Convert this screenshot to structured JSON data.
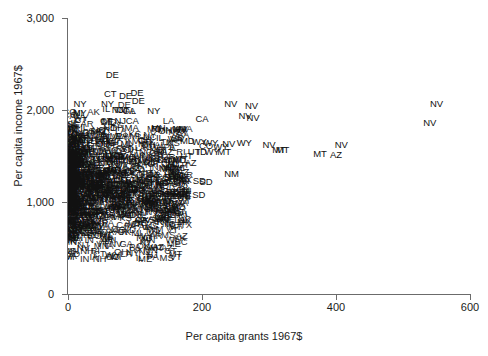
{
  "chart_data": {
    "type": "scatter",
    "title": "",
    "xlabel": "Per capita grants 1967$",
    "ylabel": "Per capita income 1967$",
    "xlim": [
      0,
      600
    ],
    "ylim": [
      0,
      3000
    ],
    "xticks": [
      0,
      200,
      400,
      600
    ],
    "xtick_labels": [
      "0",
      "200",
      "400",
      "600"
    ],
    "yticks": [
      0,
      1000,
      2000,
      3000
    ],
    "ytick_labels": [
      "0",
      "1,000",
      "2,000",
      "3,000"
    ],
    "grid": false,
    "legend": false,
    "marker_style": "text-label-state-abbreviation",
    "note": "Each plotted observation is drawn as a two-letter US state abbreviation rather than a symbol. Values below are read off the axes; the low-grant region is a dense overplotted cluster.",
    "points": [
      {
        "label": "DE",
        "x": 66,
        "y": 2380
      },
      {
        "label": "CT",
        "x": 63,
        "y": 2175
      },
      {
        "label": "DE",
        "x": 86,
        "y": 2155
      },
      {
        "label": "DE",
        "x": 103,
        "y": 2190
      },
      {
        "label": "DE",
        "x": 105,
        "y": 2100
      },
      {
        "label": "NY",
        "x": 18,
        "y": 2060
      },
      {
        "label": "NY",
        "x": 59,
        "y": 2060
      },
      {
        "label": "NV",
        "x": 243,
        "y": 2070
      },
      {
        "label": "NV",
        "x": 274,
        "y": 2045
      },
      {
        "label": "NV",
        "x": 550,
        "y": 2060
      },
      {
        "label": "NY",
        "x": 18,
        "y": 1965
      },
      {
        "label": "NJ",
        "x": 74,
        "y": 2000
      },
      {
        "label": "CT",
        "x": 82,
        "y": 2000
      },
      {
        "label": "CA",
        "x": 91,
        "y": 1985
      },
      {
        "label": "NY",
        "x": 128,
        "y": 1985
      },
      {
        "label": "CT",
        "x": 19,
        "y": 1895
      },
      {
        "label": "CT",
        "x": 57,
        "y": 1880
      },
      {
        "label": "NJ",
        "x": 78,
        "y": 1880
      },
      {
        "label": "CA",
        "x": 96,
        "y": 1880
      },
      {
        "label": "CA",
        "x": 200,
        "y": 1900
      },
      {
        "label": "NV",
        "x": 264,
        "y": 1940
      },
      {
        "label": "NV",
        "x": 276,
        "y": 1915
      },
      {
        "label": "NV",
        "x": 540,
        "y": 1860
      },
      {
        "label": "IL",
        "x": 24,
        "y": 1810
      },
      {
        "label": "NJ",
        "x": 61,
        "y": 1805
      },
      {
        "label": "OH",
        "x": 73,
        "y": 1800
      },
      {
        "label": "MA",
        "x": 95,
        "y": 1800
      },
      {
        "label": "RI",
        "x": 131,
        "y": 1795
      },
      {
        "label": "MA",
        "x": 167,
        "y": 1790
      },
      {
        "label": "NJ",
        "x": 22,
        "y": 1730
      },
      {
        "label": "IL",
        "x": 54,
        "y": 1720
      },
      {
        "label": "PA",
        "x": 80,
        "y": 1720
      },
      {
        "label": "MI",
        "x": 99,
        "y": 1715
      },
      {
        "label": "IL",
        "x": 137,
        "y": 1700
      },
      {
        "label": "WA",
        "x": 160,
        "y": 1690
      },
      {
        "label": "MD",
        "x": 178,
        "y": 1660
      },
      {
        "label": "WY",
        "x": 196,
        "y": 1650
      },
      {
        "label": "WY",
        "x": 213,
        "y": 1645
      },
      {
        "label": "NV",
        "x": 240,
        "y": 1635
      },
      {
        "label": "WY",
        "x": 263,
        "y": 1640
      },
      {
        "label": "NV",
        "x": 300,
        "y": 1620
      },
      {
        "label": "NV",
        "x": 408,
        "y": 1620
      },
      {
        "label": "OH",
        "x": 20,
        "y": 1640
      },
      {
        "label": "OH",
        "x": 52,
        "y": 1630
      },
      {
        "label": "MI",
        "x": 86,
        "y": 1630
      },
      {
        "label": "OH",
        "x": 120,
        "y": 1620
      },
      {
        "label": "CO",
        "x": 206,
        "y": 1610
      },
      {
        "label": "WY",
        "x": 228,
        "y": 1600
      },
      {
        "label": "MT",
        "x": 315,
        "y": 1570
      },
      {
        "label": "MT",
        "x": 320,
        "y": 1560
      },
      {
        "label": "AZ",
        "x": 148,
        "y": 1545
      },
      {
        "label": "UT",
        "x": 188,
        "y": 1540
      },
      {
        "label": "ID",
        "x": 200,
        "y": 1540
      },
      {
        "label": "WY",
        "x": 215,
        "y": 1545
      },
      {
        "label": "MT",
        "x": 233,
        "y": 1545
      },
      {
        "label": "MT",
        "x": 376,
        "y": 1520
      },
      {
        "label": "AZ",
        "x": 400,
        "y": 1510
      },
      {
        "label": "PA",
        "x": 24,
        "y": 1500
      },
      {
        "label": "IN",
        "x": 58,
        "y": 1500
      },
      {
        "label": "MO",
        "x": 90,
        "y": 1490
      },
      {
        "label": "KS",
        "x": 128,
        "y": 1480
      },
      {
        "label": "AZ",
        "x": 183,
        "y": 1420
      },
      {
        "label": "NE",
        "x": 28,
        "y": 1380
      },
      {
        "label": "IA",
        "x": 66,
        "y": 1370
      },
      {
        "label": "SD",
        "x": 104,
        "y": 1360
      },
      {
        "label": "AZ",
        "x": 172,
        "y": 1330
      },
      {
        "label": "NM",
        "x": 244,
        "y": 1300
      },
      {
        "label": "WI",
        "x": 30,
        "y": 1260
      },
      {
        "label": "MN",
        "x": 70,
        "y": 1250
      },
      {
        "label": "ND",
        "x": 112,
        "y": 1230
      },
      {
        "label": "ND",
        "x": 140,
        "y": 1210
      },
      {
        "label": "SD",
        "x": 196,
        "y": 1230
      },
      {
        "label": "SD",
        "x": 206,
        "y": 1215
      },
      {
        "label": "GA",
        "x": 88,
        "y": 1140
      },
      {
        "label": "KY",
        "x": 110,
        "y": 1130
      },
      {
        "label": "AL",
        "x": 124,
        "y": 1120
      },
      {
        "label": "MS",
        "x": 150,
        "y": 1090
      },
      {
        "label": "AR",
        "x": 170,
        "y": 1090
      },
      {
        "label": "SD",
        "x": 195,
        "y": 1080
      },
      {
        "label": "SC",
        "x": 36,
        "y": 1040
      },
      {
        "label": "TN",
        "x": 62,
        "y": 1030
      },
      {
        "label": "NC",
        "x": 90,
        "y": 1020
      },
      {
        "label": "VA",
        "x": 118,
        "y": 1010
      },
      {
        "label": "MS",
        "x": 20,
        "y": 760
      },
      {
        "label": "MS",
        "x": 32,
        "y": 740
      }
    ],
    "cluster_description": {
      "region": "0 < x < 160, 350 < y < 2100",
      "density": "heavy overplotting; hundreds of state-abbreviation labels",
      "states_visible": [
        "NY",
        "CT",
        "NJ",
        "IL",
        "OH",
        "PA",
        "MI",
        "CA",
        "MA",
        "RI",
        "IN",
        "MO",
        "KS",
        "NE",
        "IA",
        "WI",
        "MN",
        "SD",
        "ND",
        "GA",
        "KY",
        "AL",
        "MS",
        "AR",
        "SC",
        "TN",
        "NC",
        "VA",
        "WV",
        "OK",
        "TX",
        "FL",
        "LA",
        "ME",
        "NH",
        "VT",
        "DE",
        "MD",
        "WA",
        "OR",
        "ID",
        "UT",
        "CO",
        "WY",
        "MT",
        "NM",
        "AZ",
        "NV",
        "AK",
        "HI"
      ]
    }
  },
  "axes": {
    "y_title": "Per capita income 1967$",
    "x_title": "Per capita grants 1967$",
    "ytick_labels": [
      "3,000",
      "2,000",
      "1,000",
      "0"
    ],
    "xtick_labels": [
      "0",
      "200",
      "400",
      "600"
    ]
  },
  "colors": {
    "axis": "#6b6b6b",
    "text": "#1a1a1a",
    "marker": "#111111",
    "background": "#ffffff"
  }
}
